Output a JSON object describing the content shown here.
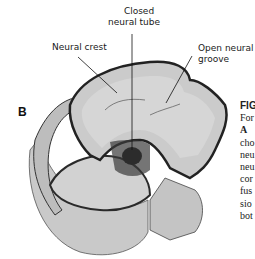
{
  "figure": {
    "panel_letter": "B",
    "labels": {
      "closed_neural_tube": [
        "Closed",
        "neural tube"
      ],
      "neural_crest": "Neural crest",
      "open_neural_groove": [
        "Open neural",
        "groove"
      ]
    },
    "caption_fragments": [
      "FIG",
      "For",
      "A",
      "cho",
      "neu",
      "neu",
      "cor",
      "fus",
      "sio",
      "bot"
    ],
    "colors": {
      "tissue_fill": "#c8c8c8",
      "tissue_light": "#d8d8d8",
      "outline": "#2a2a2a",
      "tube_core": "#0d0d0d",
      "background": "#ffffff"
    }
  }
}
